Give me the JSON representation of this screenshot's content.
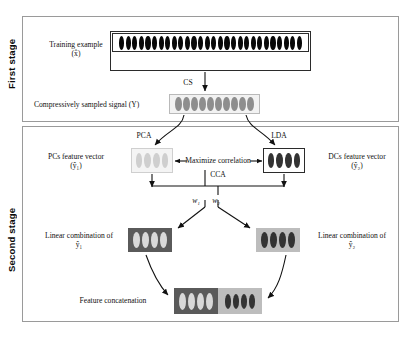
{
  "figure": {
    "stages": {
      "first": "First stage",
      "second": "Second stage"
    },
    "first_stage": {
      "training_label_line1": "Training example",
      "training_label_line2": "(x̂)",
      "training_cells": 28,
      "cs_label": "CS",
      "cs_signal_label": "Compressively sampled signal (Y)",
      "cs_signal_cells": 10
    },
    "second_stage": {
      "pca_label": "PCA",
      "lda_label": "LDA",
      "pcs_label_line1": "PCs feature vector",
      "pcs_label_line2": "(ŷ₁)",
      "dcs_label_line1": "DCs feature vector",
      "dcs_label_line2": "(ŷ₂)",
      "pcs_cells": 4,
      "dcs_cells": 4,
      "maximize_label": "Maximize correlation",
      "cca_label": "CCA",
      "weight1_label": "w₁",
      "weight2_label": "w₂",
      "linear_left_line1": "Linear combination of",
      "linear_left_line2": "ŷ₁",
      "linear_right_line1": "Linear combination of",
      "linear_right_line2": "ŷ₂",
      "linear_left_cells": 4,
      "linear_right_cells": 4,
      "concat_label": "Feature concatenation",
      "concat_left_cells": 4,
      "concat_right_cells": 4
    },
    "colors": {
      "black_cell": "#080808",
      "dark_cell": "#333333",
      "mid_gray_cell": "#8e8e8e",
      "light_cell": "#cfcfcf",
      "dark_panel": "#5a5a5a",
      "light_panel": "#bdbdbd",
      "frame_line": "#9a9a9a",
      "box_line": "#3a3a3a",
      "arrow": "#111111",
      "background": "#ffffff"
    }
  }
}
